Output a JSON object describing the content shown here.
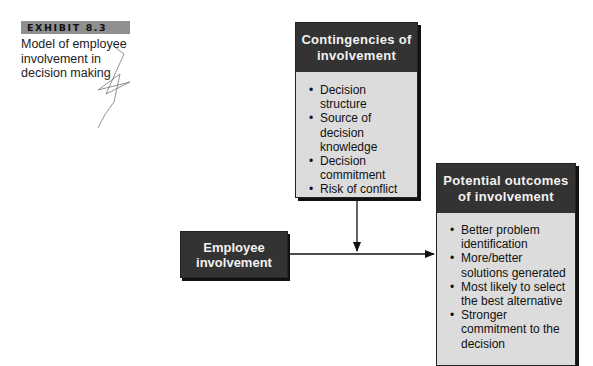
{
  "exhibit": {
    "label": "EXHIBIT 8.3",
    "caption": "Model of employee involvement in decision making"
  },
  "nodes": {
    "contingencies": {
      "title": "Contingencies of involvement",
      "items": [
        "Decision structure",
        "Source of decision knowledge",
        "Decision commitment",
        "Risk of conflict"
      ]
    },
    "employee": {
      "title": "Employee involvement"
    },
    "outcomes": {
      "title": "Potential outcomes of involvement",
      "items": [
        "Better problem identification",
        "More/better solutions generated",
        "Most likely to select the best alternative",
        "Stronger commitment to the decision"
      ]
    }
  },
  "edges": [
    {
      "from": "employee",
      "to": "outcomes",
      "style": "solid-arrow"
    },
    {
      "from": "contingencies",
      "to": "employee->outcomes edge",
      "style": "solid-arrow (moderator)"
    }
  ],
  "colors": {
    "header_fill": "#333333",
    "body_fill": "#dcdcdc",
    "tag_fill": "#8f8f8f",
    "line": "#111111"
  }
}
